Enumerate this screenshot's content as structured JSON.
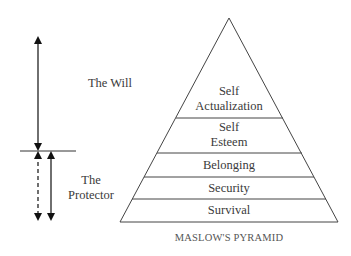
{
  "left": {
    "will_label": "The Will",
    "protector_label_line1": "The",
    "protector_label_line2": "Protector"
  },
  "pyramid": {
    "caption": "MASLOW'S PYRAMID",
    "levels": [
      {
        "line1": "Self",
        "line2": "Actualization"
      },
      {
        "line1": "Self",
        "line2": "Esteem"
      },
      {
        "line1": "Belonging"
      },
      {
        "line1": "Security"
      },
      {
        "line1": "Survival"
      }
    ]
  }
}
